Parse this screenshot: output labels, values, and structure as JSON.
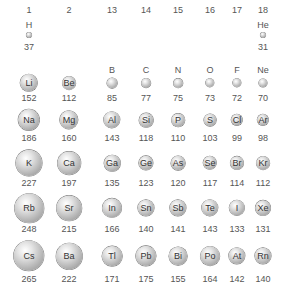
{
  "groups": [
    "1",
    "2",
    "13",
    "14",
    "15",
    "16",
    "17",
    "18"
  ],
  "chart_data": {
    "type": "table",
    "columns": [
      "1",
      "2",
      "13",
      "14",
      "15",
      "16",
      "17",
      "18"
    ],
    "rows": [
      [
        {
          "s": "H",
          "r": 37
        },
        null,
        null,
        null,
        null,
        null,
        null,
        {
          "s": "He",
          "r": 31
        }
      ],
      [
        {
          "s": "Li",
          "r": 152
        },
        {
          "s": "Be",
          "r": 112
        },
        {
          "s": "B",
          "r": 85
        },
        {
          "s": "C",
          "r": 77
        },
        {
          "s": "N",
          "r": 75
        },
        {
          "s": "O",
          "r": 73
        },
        {
          "s": "F",
          "r": 72
        },
        {
          "s": "Ne",
          "r": 70
        }
      ],
      [
        {
          "s": "Na",
          "r": 186
        },
        {
          "s": "Mg",
          "r": 160
        },
        {
          "s": "Al",
          "r": 143
        },
        {
          "s": "Si",
          "r": 118
        },
        {
          "s": "P",
          "r": 110
        },
        {
          "s": "S",
          "r": 103
        },
        {
          "s": "Cl",
          "r": 99
        },
        {
          "s": "Ar",
          "r": 98
        }
      ],
      [
        {
          "s": "K",
          "r": 227
        },
        {
          "s": "Ca",
          "r": 197
        },
        {
          "s": "Ga",
          "r": 135
        },
        {
          "s": "Ge",
          "r": 123
        },
        {
          "s": "As",
          "r": 120
        },
        {
          "s": "Se",
          "r": 117
        },
        {
          "s": "Br",
          "r": 114
        },
        {
          "s": "Kr",
          "r": 112
        }
      ],
      [
        {
          "s": "Rb",
          "r": 248
        },
        {
          "s": "Sr",
          "r": 215
        },
        {
          "s": "In",
          "r": 166
        },
        {
          "s": "Sn",
          "r": 140
        },
        {
          "s": "Sb",
          "r": 141
        },
        {
          "s": "Te",
          "r": 143
        },
        {
          "s": "I",
          "r": 133
        },
        {
          "s": "Xe",
          "r": 131
        }
      ],
      [
        {
          "s": "Cs",
          "r": 265
        },
        {
          "s": "Ba",
          "r": 222
        },
        {
          "s": "Tl",
          "r": 171
        },
        {
          "s": "Pb",
          "r": 175
        },
        {
          "s": "Bi",
          "r": 155
        },
        {
          "s": "Po",
          "r": 164
        },
        {
          "s": "At",
          "r": 142
        },
        {
          "s": "Rn",
          "r": 140
        }
      ]
    ]
  }
}
